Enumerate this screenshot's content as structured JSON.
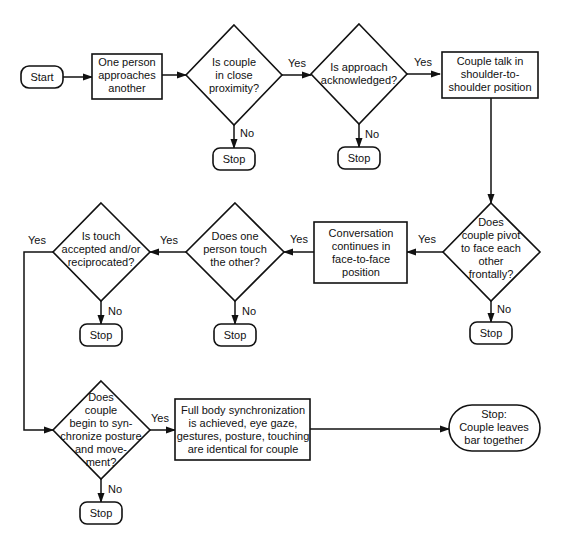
{
  "diagram": {
    "type": "flowchart",
    "nodes": {
      "start": {
        "kind": "terminal",
        "lines": [
          "Start"
        ]
      },
      "approach": {
        "kind": "process",
        "lines": [
          "One person",
          "approaches",
          "another"
        ]
      },
      "proximity": {
        "kind": "decision",
        "lines": [
          "Is couple",
          "in close",
          "proximity?"
        ]
      },
      "acknowledged": {
        "kind": "decision",
        "lines": [
          "Is approach",
          "acknowledged?"
        ]
      },
      "shoulder": {
        "kind": "process",
        "lines": [
          "Couple talk in",
          "shoulder-to-",
          "shoulder position"
        ]
      },
      "pivot": {
        "kind": "decision",
        "lines": [
          "Does",
          "couple pivot",
          "to face each",
          "other",
          "frontally?"
        ]
      },
      "face": {
        "kind": "process",
        "lines": [
          "Conversation",
          "continues in",
          "face-to-face",
          "position"
        ]
      },
      "touch": {
        "kind": "decision",
        "lines": [
          "Does one",
          "person touch",
          "the other?"
        ]
      },
      "accepted": {
        "kind": "decision",
        "lines": [
          "Is touch",
          "accepted and/or",
          "reciprocated?"
        ]
      },
      "synchronize": {
        "kind": "decision",
        "lines": [
          "Does",
          "couple",
          "begin to syn-",
          "chronize posture",
          "and move-",
          "ment?"
        ]
      },
      "full_sync": {
        "kind": "process",
        "lines": [
          "Full body synchronization",
          "is achieved, eye gaze,",
          "gestures, posture, touching",
          "are identical for couple"
        ]
      },
      "end": {
        "kind": "terminal",
        "lines": [
          "Stop:",
          "Couple leaves",
          "bar together"
        ]
      },
      "stop1": {
        "kind": "terminal",
        "lines": [
          "Stop"
        ]
      },
      "stop2": {
        "kind": "terminal",
        "lines": [
          "Stop"
        ]
      },
      "stop3": {
        "kind": "terminal",
        "lines": [
          "Stop"
        ]
      },
      "stop4": {
        "kind": "terminal",
        "lines": [
          "Stop"
        ]
      },
      "stop5": {
        "kind": "terminal",
        "lines": [
          "Stop"
        ]
      },
      "stop6": {
        "kind": "terminal",
        "lines": [
          "Stop"
        ]
      }
    },
    "edge_labels": {
      "yes": "Yes",
      "no": "No"
    },
    "edges": [
      {
        "from": "start",
        "to": "approach",
        "label": ""
      },
      {
        "from": "approach",
        "to": "proximity",
        "label": ""
      },
      {
        "from": "proximity",
        "to": "acknowledged",
        "label": "Yes"
      },
      {
        "from": "proximity",
        "to": "stop1",
        "label": "No"
      },
      {
        "from": "acknowledged",
        "to": "shoulder",
        "label": "Yes"
      },
      {
        "from": "acknowledged",
        "to": "stop2",
        "label": "No"
      },
      {
        "from": "shoulder",
        "to": "pivot",
        "label": ""
      },
      {
        "from": "pivot",
        "to": "face",
        "label": "Yes"
      },
      {
        "from": "pivot",
        "to": "stop3",
        "label": "No"
      },
      {
        "from": "face",
        "to": "touch",
        "label": "Yes"
      },
      {
        "from": "touch",
        "to": "accepted",
        "label": "Yes"
      },
      {
        "from": "touch",
        "to": "stop4",
        "label": "No"
      },
      {
        "from": "accepted",
        "to": "synchronize",
        "label": "Yes"
      },
      {
        "from": "accepted",
        "to": "stop5",
        "label": "No"
      },
      {
        "from": "synchronize",
        "to": "full_sync",
        "label": "Yes"
      },
      {
        "from": "synchronize",
        "to": "stop6",
        "label": "No"
      },
      {
        "from": "full_sync",
        "to": "end",
        "label": ""
      }
    ]
  }
}
